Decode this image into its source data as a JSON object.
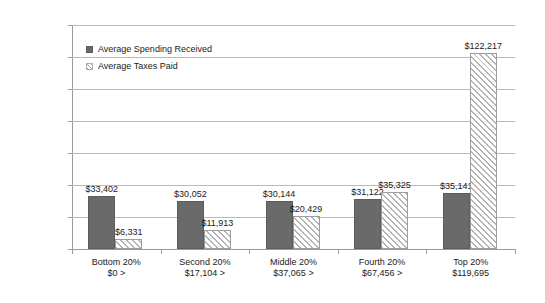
{
  "chart_data": {
    "type": "bar",
    "title": "",
    "xlabel": "",
    "ylabel": "",
    "ylim": [
      0,
      140000
    ],
    "ytick_step": 20000,
    "grid": true,
    "legend_position": "inside-top-left",
    "categories": [
      "Bottom 20%",
      "Second 20%",
      "Middle 20%",
      "Fourth 20%",
      "Top 20%"
    ],
    "category_sublabels": [
      "$0 >",
      "$17,104 >",
      "$37,065 >",
      "$67,456 >",
      "$119,695"
    ],
    "ytick_labels": [
      "$0",
      "$20,000",
      "$40,000",
      "$60,000",
      "$80,000",
      "$100,000",
      "$120,000",
      "$140,000"
    ],
    "ytick_values": [
      0,
      20000,
      40000,
      60000,
      80000,
      100000,
      120000,
      140000
    ],
    "series": [
      {
        "name": "Average Spending Received",
        "key": "spending",
        "color": "#6a6a6a",
        "fill": "solid",
        "values": [
          33402,
          30052,
          30144,
          31122,
          35141
        ],
        "labels": [
          "$33,402",
          "$30,052",
          "$30,144",
          "$31,122",
          "$35,141"
        ]
      },
      {
        "name": "Average Taxes Paid",
        "key": "taxes",
        "color": "#b5b5b5",
        "fill": "diagonal-hatch",
        "values": [
          6331,
          11913,
          20429,
          35325,
          122217
        ],
        "labels": [
          "$6,331",
          "$11,913",
          "$20,429",
          "$35,325",
          "$122,217"
        ]
      }
    ]
  },
  "legend": {
    "items": [
      {
        "label": "Average Spending Received",
        "swatch": "spending-swatch-icon"
      },
      {
        "label": "Average Taxes Paid",
        "swatch": "taxes-swatch-icon"
      }
    ]
  },
  "colors": {
    "spending_bar": "#6a6a6a",
    "taxes_hatch": "#b5b5b5",
    "gridline": "#b9b9b9",
    "axis": "#9a9a9a",
    "background": "#ffffff",
    "text": "#1a1a1a"
  }
}
